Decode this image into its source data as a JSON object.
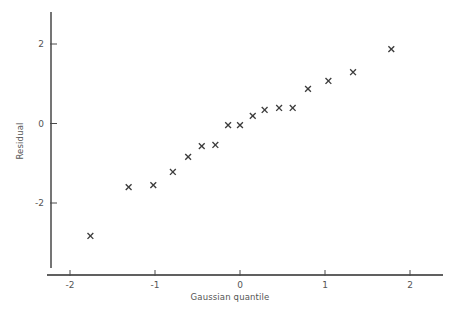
{
  "chart_data": {
    "type": "scatter",
    "title": "",
    "xlabel": "Gaussian quantile",
    "ylabel": "Residual",
    "xlim": [
      -2.4,
      2.55
    ],
    "ylim": [
      -3.2,
      2.7
    ],
    "xticks": [
      -2,
      -1,
      0,
      1,
      2
    ],
    "xtick_labels": [
      "-2",
      "-1",
      "0",
      "1",
      "2"
    ],
    "yticks": [
      -2,
      0,
      2
    ],
    "ytick_labels": [
      "-2",
      "0",
      "2"
    ],
    "grid": false,
    "legend": false,
    "marker": "x",
    "marker_color": "#3c3c3c",
    "points": [
      {
        "x": -1.76,
        "y": -2.83
      },
      {
        "x": -1.31,
        "y": -1.6
      },
      {
        "x": -1.02,
        "y": -1.55
      },
      {
        "x": -0.79,
        "y": -1.22
      },
      {
        "x": -0.61,
        "y": -0.84
      },
      {
        "x": -0.45,
        "y": -0.57
      },
      {
        "x": -0.29,
        "y": -0.54
      },
      {
        "x": -0.14,
        "y": -0.04
      },
      {
        "x": 0.0,
        "y": -0.04
      },
      {
        "x": 0.15,
        "y": 0.19
      },
      {
        "x": 0.29,
        "y": 0.34
      },
      {
        "x": 0.46,
        "y": 0.39
      },
      {
        "x": 0.62,
        "y": 0.39
      },
      {
        "x": 0.8,
        "y": 0.87
      },
      {
        "x": 1.04,
        "y": 1.07
      },
      {
        "x": 1.33,
        "y": 1.29
      },
      {
        "x": 1.78,
        "y": 1.87
      }
    ]
  },
  "axes": {
    "x_axis_name": "gaussian-quantile-axis",
    "y_axis_name": "residual-axis"
  }
}
